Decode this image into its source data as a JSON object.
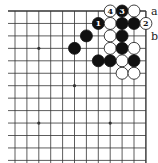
{
  "diagram": {
    "type": "go-board-corner",
    "columns": 12,
    "rows": 12,
    "colors": {
      "line": "#333333",
      "black": "#111111",
      "white": "#ffffff",
      "background": "#ffffff"
    },
    "star_points": [
      {
        "col": 2,
        "row": 3
      },
      {
        "col": 5,
        "row": 6
      },
      {
        "col": 2,
        "row": 9
      },
      {
        "col": 8,
        "row": 9
      }
    ],
    "stones": [
      {
        "col": 8,
        "row": 0,
        "color": "white",
        "label": "4"
      },
      {
        "col": 9,
        "row": 0,
        "color": "black",
        "label": "3"
      },
      {
        "col": 10,
        "row": 0,
        "color": "white",
        "label": ""
      },
      {
        "col": 7,
        "row": 1,
        "color": "black",
        "label": "1"
      },
      {
        "col": 8,
        "row": 1,
        "color": "white",
        "label": ""
      },
      {
        "col": 9,
        "row": 1,
        "color": "black",
        "label": ""
      },
      {
        "col": 10,
        "row": 1,
        "color": "black",
        "label": ""
      },
      {
        "col": 11,
        "row": 1,
        "color": "white",
        "label": "2"
      },
      {
        "col": 6,
        "row": 2,
        "color": "black",
        "label": ""
      },
      {
        "col": 8,
        "row": 2,
        "color": "white",
        "label": ""
      },
      {
        "col": 9,
        "row": 2,
        "color": "black",
        "label": ""
      },
      {
        "col": 5,
        "row": 3,
        "color": "black",
        "label": ""
      },
      {
        "col": 8,
        "row": 3,
        "color": "white",
        "label": ""
      },
      {
        "col": 9,
        "row": 3,
        "color": "black",
        "label": ""
      },
      {
        "col": 10,
        "row": 3,
        "color": "white",
        "label": ""
      },
      {
        "col": 7,
        "row": 4,
        "color": "black",
        "label": ""
      },
      {
        "col": 8,
        "row": 4,
        "color": "black",
        "label": ""
      },
      {
        "col": 9,
        "row": 4,
        "color": "white",
        "label": ""
      },
      {
        "col": 10,
        "row": 4,
        "color": "black",
        "label": ""
      },
      {
        "col": 9,
        "row": 5,
        "color": "white",
        "label": ""
      },
      {
        "col": 10,
        "row": 5,
        "color": "white",
        "label": ""
      }
    ],
    "point_labels": [
      {
        "text": "a",
        "row": 0
      },
      {
        "text": "b",
        "row": 2
      }
    ]
  }
}
